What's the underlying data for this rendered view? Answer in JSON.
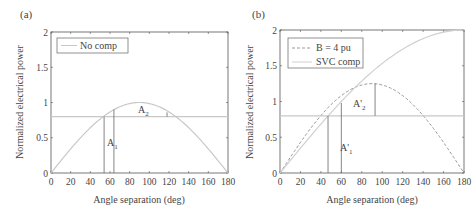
{
  "chart_data": [
    {
      "type": "line",
      "panel_label": "(a)",
      "title": "",
      "xlabel": "Angle separation (deg)",
      "ylabel": "Normalized electrical power",
      "xlim": [
        0,
        180
      ],
      "ylim": [
        0,
        2
      ],
      "xticks": [
        "0",
        "20",
        "40",
        "60",
        "80",
        "100",
        "120",
        "140",
        "160",
        "180"
      ],
      "yticks": [
        "0",
        "0.5",
        "1",
        "1.5",
        "2"
      ],
      "legend": {
        "position": "upper left",
        "entries": [
          "No comp"
        ]
      },
      "series": [
        {
          "name": "No comp",
          "style": "solid",
          "color": "#c8c8c8",
          "x": [
            0,
            20,
            40,
            60,
            80,
            90,
            100,
            120,
            140,
            160,
            180
          ],
          "y": [
            0,
            0.34,
            0.64,
            0.87,
            0.98,
            1.0,
            0.98,
            0.87,
            0.64,
            0.34,
            0
          ]
        },
        {
          "name": "Mechanical power",
          "style": "solid",
          "color": "#c8c8c8",
          "x": [
            0,
            180
          ],
          "y": [
            0.8,
            0.8
          ]
        }
      ],
      "annotations": [
        {
          "text": "A",
          "sub": "1",
          "x": 58,
          "y": 0.45
        },
        {
          "text": "A",
          "sub": "2",
          "x": 90,
          "y": 0.9
        }
      ],
      "vlines": [
        {
          "x": 54,
          "y0": 0,
          "y1": 0.8
        },
        {
          "x": 64,
          "y0": 0,
          "y1": 0.9
        },
        {
          "x": 118,
          "y0": 0.8,
          "y1": 0.86
        }
      ]
    },
    {
      "type": "line",
      "panel_label": "(b)",
      "title": "",
      "xlabel": "Angle separation (deg)",
      "ylabel": "Normalized electrical power",
      "xlim": [
        0,
        180
      ],
      "ylim": [
        0,
        2
      ],
      "xticks": [
        "0",
        "20",
        "40",
        "60",
        "80",
        "100",
        "120",
        "140",
        "160",
        "180"
      ],
      "yticks": [
        "0",
        "0.5",
        "1",
        "1.5",
        "2"
      ],
      "legend": {
        "position": "upper left",
        "entries": [
          "B = 4 pu",
          "SVC comp"
        ]
      },
      "series": [
        {
          "name": "B = 4 pu",
          "style": "dashed",
          "color": "#999999",
          "x": [
            0,
            20,
            40,
            60,
            80,
            90,
            100,
            120,
            140,
            160,
            180
          ],
          "y": [
            0,
            0.43,
            0.8,
            1.08,
            1.23,
            1.25,
            1.23,
            1.08,
            0.8,
            0.43,
            0
          ]
        },
        {
          "name": "SVC comp",
          "style": "solid",
          "color": "#d0d0d0",
          "x": [
            0,
            20,
            40,
            60,
            80,
            100,
            120,
            140,
            160,
            180
          ],
          "y": [
            0,
            0.35,
            0.69,
            1.0,
            1.29,
            1.53,
            1.73,
            1.88,
            1.97,
            2.0
          ]
        },
        {
          "name": "Mechanical power",
          "style": "solid",
          "color": "#c8c8c8",
          "x": [
            0,
            180
          ],
          "y": [
            0.8,
            0.8
          ]
        }
      ],
      "annotations": [
        {
          "text": "A'",
          "sub": "1",
          "x": 62,
          "y": 0.5
        },
        {
          "text": "A'",
          "sub": "2",
          "x": 77,
          "y": 0.93
        }
      ],
      "vlines": [
        {
          "x": 47,
          "y0": 0,
          "y1": 0.8
        },
        {
          "x": 60,
          "y0": 0,
          "y1": 0.98
        },
        {
          "x": 93,
          "y0": 0.8,
          "y1": 1.25
        }
      ]
    }
  ],
  "panels": {
    "a": {
      "label": "(a)",
      "legend": [
        "No comp"
      ],
      "xlabel": "Angle separation (deg)",
      "ylabel": "Normalized electrical power",
      "ann1": "A",
      "ann1_sub": "1",
      "ann2": "A",
      "ann2_sub": "2"
    },
    "b": {
      "label": "(b)",
      "legend": [
        "B = 4 pu",
        "SVC comp"
      ],
      "xlabel": "Angle separation (deg)",
      "ylabel": "Normalized electrical power",
      "ann1": "A'",
      "ann1_sub": "1",
      "ann2": "A'",
      "ann2_sub": "2"
    }
  },
  "colors": {
    "axis": "#555555",
    "curve_light": "#c8c8c8",
    "curve_dashed": "#999999",
    "marker_line": "#666666"
  }
}
